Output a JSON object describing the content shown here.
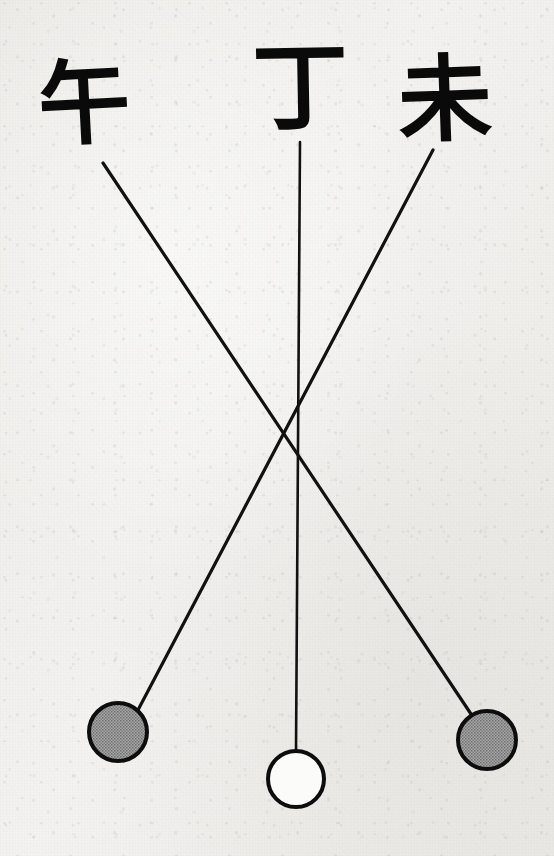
{
  "figure": {
    "background_color": "#f2f1ef",
    "ink_color": "#0a0a0a",
    "filled_node_color": "#969696",
    "hollow_node_color": "#fbfbfa"
  },
  "labels": {
    "left": {
      "text": "午",
      "reading": "wu",
      "position": {
        "x": 38,
        "y": 58
      },
      "font_size": 92
    },
    "center": {
      "text": "丁",
      "reading": "ding",
      "position": {
        "x": 252,
        "y": 40
      },
      "font_size": 96
    },
    "right": {
      "text": "未",
      "reading": "wei",
      "position": {
        "x": 398,
        "y": 52
      },
      "font_size": 94
    }
  },
  "connectors": [
    {
      "name": "left-label-to-right-node",
      "from_label": "午",
      "to_node": "right-node",
      "x1": 103,
      "y1": 163,
      "x2": 471,
      "y2": 714,
      "stroke_width": 3.2,
      "color": "#111111"
    },
    {
      "name": "center-label-to-center-node",
      "from_label": "丁",
      "to_node": "center-node",
      "x1": 300,
      "y1": 142,
      "x2": 296,
      "y2": 752,
      "stroke_width": 2.6,
      "color": "#111111"
    },
    {
      "name": "right-label-to-left-node",
      "from_label": "未",
      "to_node": "left-node",
      "x1": 433,
      "y1": 150,
      "x2": 138,
      "y2": 710,
      "stroke_width": 3.2,
      "color": "#111111"
    }
  ],
  "crossing_point": {
    "x": 277,
    "y": 427
  },
  "nodes": [
    {
      "name": "left-node",
      "label_source": "未",
      "fill": "filled",
      "fill_color": "#969696",
      "stroke_color": "#0d0d0d",
      "cx": 118,
      "cy": 732,
      "r": 29,
      "stroke_width": 4
    },
    {
      "name": "center-node",
      "label_source": "丁",
      "fill": "hollow",
      "fill_color": "#fbfbfa",
      "stroke_color": "#0d0d0d",
      "cx": 296,
      "cy": 779,
      "r": 28,
      "stroke_width": 4
    },
    {
      "name": "right-node",
      "label_source": "午",
      "fill": "filled",
      "fill_color": "#969696",
      "stroke_color": "#0d0d0d",
      "cx": 487,
      "cy": 740,
      "r": 29,
      "stroke_width": 4
    }
  ]
}
